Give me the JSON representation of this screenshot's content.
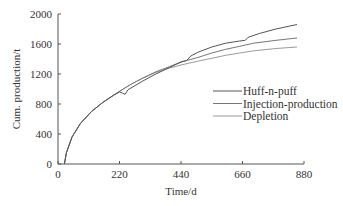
{
  "chart_data": {
    "type": "line",
    "title": "",
    "xlabel": "Time/d",
    "ylabel": "Cum. production/t",
    "xlim": [
      0,
      880
    ],
    "ylim": [
      0,
      2000
    ],
    "xticks": [
      0,
      220,
      440,
      660,
      880
    ],
    "yticks": [
      0,
      400,
      800,
      1200,
      1600,
      2000
    ],
    "grid": false,
    "legend_position": "center-right",
    "series": [
      {
        "name": "Huff-n-puff",
        "color": "#555555",
        "x": [
          23,
          30,
          50,
          80,
          120,
          160,
          200,
          220,
          230,
          240,
          250,
          300,
          350,
          400,
          440,
          460,
          475,
          500,
          550,
          600,
          650,
          670,
          680,
          720,
          780,
          855
        ],
        "y": [
          0,
          150,
          360,
          540,
          700,
          820,
          920,
          960,
          945,
          930,
          990,
          1100,
          1200,
          1290,
          1360,
          1380,
          1440,
          1490,
          1560,
          1610,
          1640,
          1650,
          1690,
          1740,
          1800,
          1860
        ]
      },
      {
        "name": "Injection-production",
        "color": "#777777",
        "x": [
          23,
          30,
          50,
          80,
          120,
          160,
          200,
          220,
          260,
          300,
          350,
          400,
          440,
          500,
          550,
          600,
          650,
          700,
          780,
          855
        ],
        "y": [
          0,
          150,
          360,
          540,
          700,
          820,
          920,
          970,
          1060,
          1140,
          1230,
          1300,
          1360,
          1420,
          1480,
          1530,
          1570,
          1610,
          1650,
          1680
        ]
      },
      {
        "name": "Depletion",
        "color": "#9a9a9a",
        "x": [
          23,
          30,
          50,
          80,
          120,
          160,
          200,
          220,
          260,
          300,
          350,
          400,
          440,
          500,
          550,
          600,
          650,
          700,
          780,
          855
        ],
        "y": [
          0,
          150,
          360,
          540,
          700,
          820,
          920,
          970,
          1060,
          1140,
          1220,
          1280,
          1320,
          1370,
          1410,
          1450,
          1480,
          1510,
          1540,
          1560
        ]
      }
    ]
  },
  "axes": {
    "x_title": "Time/d",
    "y_title": "Cum. production/t",
    "x_ticks": [
      "0",
      "220",
      "440",
      "660",
      "880"
    ],
    "y_ticks": [
      "0",
      "400",
      "800",
      "1200",
      "1600",
      "2000"
    ]
  },
  "legend": {
    "items": [
      {
        "label": "Huff-n-puff",
        "color": "#555555"
      },
      {
        "label": "Injection-production",
        "color": "#777777"
      },
      {
        "label": "Depletion",
        "color": "#9a9a9a"
      }
    ]
  }
}
